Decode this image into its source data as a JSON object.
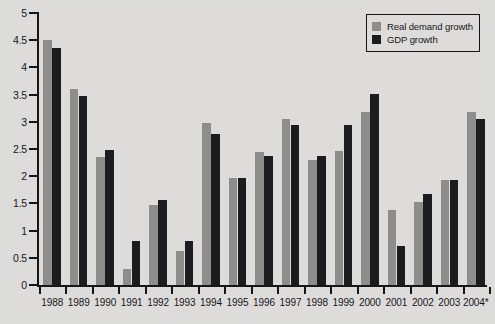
{
  "chart_data": {
    "type": "bar",
    "title": "",
    "subtitle": "",
    "xlabel": "",
    "ylabel": "",
    "ylim": [
      0,
      5
    ],
    "ytick_step": 0.5,
    "yticks": [
      "0",
      "0.5",
      "1",
      "1.5",
      "2",
      "2.5",
      "3",
      "3.5",
      "4",
      "4.5",
      "5"
    ],
    "grid": false,
    "legend_position": "top-right",
    "categories": [
      "1988",
      "1989",
      "1990",
      "1991",
      "1992",
      "1993",
      "1994",
      "1995",
      "1996",
      "1997",
      "1998",
      "1999",
      "2000",
      "2001",
      "2002",
      "2003",
      "2004*"
    ],
    "series": [
      {
        "name": "Real demand growth",
        "color": "#8d8d8b",
        "values": [
          4.5,
          3.6,
          2.35,
          0.3,
          1.48,
          0.63,
          2.97,
          1.96,
          2.44,
          3.06,
          2.29,
          2.47,
          3.18,
          1.38,
          1.52,
          1.93,
          3.18
        ]
      },
      {
        "name": "GDP growth",
        "color": "#1b1c20",
        "values": [
          4.35,
          3.48,
          2.49,
          0.81,
          1.56,
          0.8,
          2.78,
          1.96,
          2.38,
          2.95,
          2.37,
          2.95,
          3.52,
          0.71,
          1.68,
          1.93,
          3.05
        ]
      }
    ]
  },
  "legend": {
    "items": [
      {
        "label": "Real demand growth"
      },
      {
        "label": "GDP growth"
      }
    ]
  },
  "colors": {
    "background": "#dcdcda",
    "axis": "#15161a",
    "series_0": "#8d8d8b",
    "series_1": "#1b1c20"
  }
}
